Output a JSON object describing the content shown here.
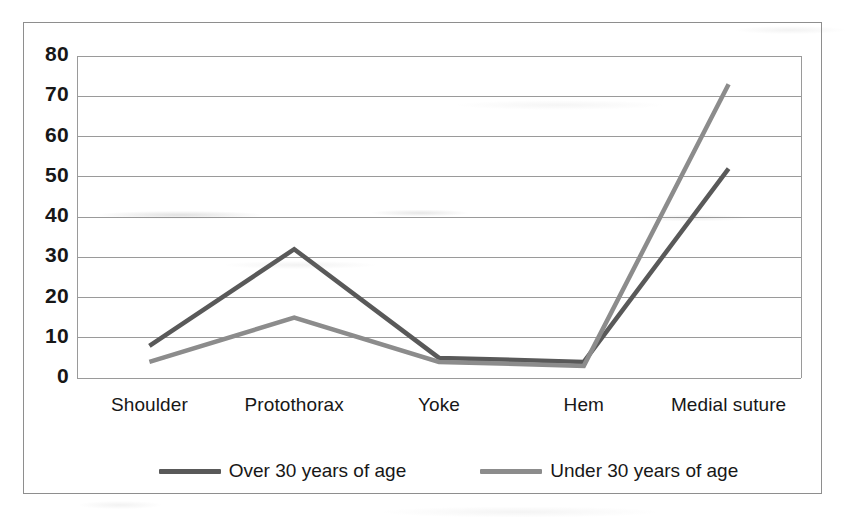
{
  "chart_data": {
    "type": "line",
    "title": "",
    "xlabel": "",
    "ylabel": "",
    "categories": [
      "Shoulder",
      "Protothorax",
      "Yoke",
      "Hem",
      "Medial suture"
    ],
    "series": [
      {
        "name": "Over 30 years of age",
        "color": "#595959",
        "values": [
          8,
          32,
          5,
          4,
          52
        ]
      },
      {
        "name": "Under 30 years of age",
        "color": "#8c8c8c",
        "values": [
          4,
          15,
          4,
          3,
          73
        ]
      }
    ],
    "ylim": [
      0,
      80
    ],
    "ytick_labels": [
      "80",
      "70",
      "60",
      "50",
      "40",
      "30",
      "20",
      "10",
      "0"
    ],
    "ytick_values": [
      80,
      70,
      60,
      50,
      40,
      30,
      20,
      10,
      0
    ],
    "grid": true,
    "legend_position": "bottom"
  },
  "legend": {
    "entries": [
      {
        "label": "Over 30 years of age"
      },
      {
        "label": "Under 30 years of age"
      }
    ]
  },
  "colors": {
    "series_over_30": "#595959",
    "series_under_30": "#8c8c8c",
    "gridline": "#9a9a9a",
    "frame": "#8e8e8e",
    "text": "#171717"
  }
}
